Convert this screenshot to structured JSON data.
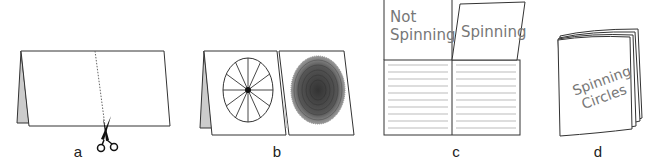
{
  "figure": {
    "steps": [
      {
        "id": "a",
        "label": "a",
        "description": "Tent-folded sheet with dotted cut line down the middle of the front panel; scissors at bottom"
      },
      {
        "id": "b",
        "label": "b",
        "description": "Front flap cut into two panels: left shows a wheel with spokes (not spinning), right shows a blurred circle (spinning)"
      },
      {
        "id": "c",
        "label": "c",
        "description": "Opened booklet: top flaps labelled, lined writing area below"
      },
      {
        "id": "d",
        "label": "d",
        "description": "Finished booklet cover"
      }
    ],
    "flap_labels": {
      "left_line1": "Not",
      "left_line2": "Spinning",
      "right": "Spinning"
    },
    "cover_title": {
      "line1": "Spinning",
      "line2": "Circles"
    },
    "icons": [
      "scissors-icon",
      "spoked-wheel-icon",
      "blurred-wheel-icon"
    ],
    "colors": {
      "stroke": "#333333",
      "fold_shadow": "#cccccc",
      "handwriting": "#777777",
      "rule_lines": "#aaaaaa"
    }
  }
}
